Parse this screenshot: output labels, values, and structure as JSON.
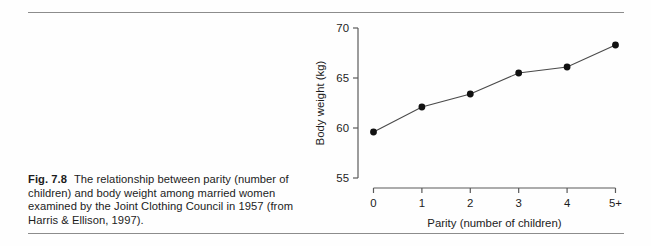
{
  "figure": {
    "caption_number": "Fig. 7.8",
    "caption_text": "The relationship between parity (number of children) and body weight among married women examined by the Joint Clothing Council in 1957 (from Harris & Ellison, 1997)."
  },
  "chart_data": {
    "type": "line",
    "title": "",
    "xlabel": "Parity (number of children)",
    "ylabel": "Body weight (kg)",
    "categories": [
      "0",
      "1",
      "2",
      "3",
      "4",
      "5+"
    ],
    "x": [
      0,
      1,
      2,
      3,
      4,
      5
    ],
    "values": [
      59.6,
      62.1,
      63.4,
      65.5,
      66.1,
      68.3
    ],
    "series": [
      {
        "name": "Body weight",
        "values": [
          59.6,
          62.1,
          63.4,
          65.5,
          66.1,
          68.3
        ]
      }
    ],
    "ylim": [
      54.0,
      70.6
    ],
    "yticks": [
      55,
      60,
      65,
      70
    ],
    "ytick_labels": [
      "55",
      "60",
      "65",
      "70"
    ],
    "xlim": [
      -0.32,
      5.3
    ],
    "grid": false,
    "legend": false,
    "marker": "filled-circle",
    "line_color": "#4a4a4a",
    "marker_color": "#111111",
    "axis_color": "#5a5a5a"
  },
  "colors": {
    "background": "#fefefe",
    "rule": "#8c8c8c",
    "text": "#1c1c1c"
  }
}
